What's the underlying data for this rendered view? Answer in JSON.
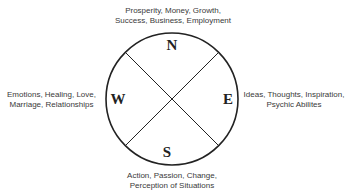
{
  "diagram": {
    "type": "compass-quadrant",
    "center": {
      "x": 172,
      "y": 99
    },
    "radius": 66,
    "stroke_color": "#222222",
    "directions": {
      "north": {
        "letter": "N",
        "lines": [
          "Prosperity, Money, Growth,",
          "Success, Business, Employment"
        ]
      },
      "west": {
        "letter": "W",
        "lines": [
          "Emotions, Healing, Love,",
          "Marriage, Relationships"
        ]
      },
      "east": {
        "letter": "E",
        "lines": [
          "Ideas, Thoughts, Inspiration,",
          "Psychic Abilites"
        ]
      },
      "south": {
        "letter": "S",
        "lines": [
          "Action, Passion, Change,",
          "Perception of Situations"
        ]
      }
    }
  }
}
